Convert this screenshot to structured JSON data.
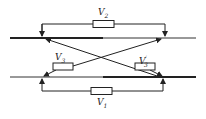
{
  "diagram": {
    "type": "circuit-crossover-connection",
    "labels": {
      "top_resistor": {
        "base": "V",
        "sub": "2",
        "prime": ""
      },
      "bottom_resistor": {
        "base": "V",
        "sub": "1",
        "prime": ""
      },
      "left_cross_resistor": {
        "base": "V",
        "sub": "3",
        "prime": ""
      },
      "right_cross_resistor": {
        "base": "V",
        "sub": "3",
        "prime": "′"
      }
    },
    "colors": {
      "line": "#222222",
      "background": "#ffffff"
    }
  }
}
